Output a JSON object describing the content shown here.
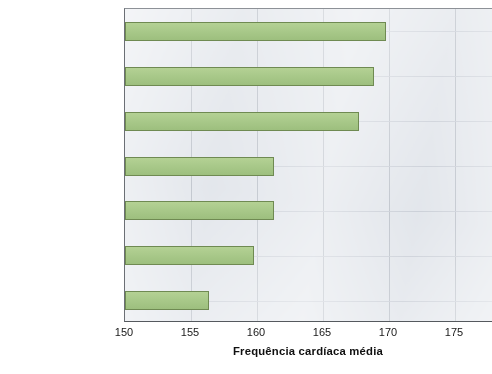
{
  "chart_data": {
    "type": "bar",
    "orientation": "horizontal",
    "title": "",
    "xlabel": "Frequência cardíaca média",
    "ylabel": "",
    "xlim": [
      150,
      176
    ],
    "xticks": [
      150,
      155,
      160,
      165,
      170,
      175
    ],
    "xtick_labels": [
      "150",
      "155",
      "160",
      "165",
      "170",
      "175"
    ],
    "grid": true,
    "legend": "none",
    "categories": [
      "Flanagan (2002)",
      "Ali (1991)",
      "Van Gool (1988)",
      "Florida-James (1995)",
      "Ogushi (1993)",
      "Bangsbo (1991)",
      "Reilly (1986)"
    ],
    "values": [
      169.8,
      168.9,
      167.7,
      161.3,
      161.3,
      159.8,
      156.4
    ],
    "bars": [
      {
        "author": "Flanagan",
        "year": "(2002)",
        "value": 169.8
      },
      {
        "author": "Ali",
        "year": "(1991)",
        "value": 168.9
      },
      {
        "author": "Van Gool",
        "year": "(1988)",
        "value": 167.7
      },
      {
        "author": "Florida-James",
        "year": "(1995)",
        "value": 161.3
      },
      {
        "author": "Ogushi",
        "year": "(1993)",
        "value": 161.3
      },
      {
        "author": "Bangsbo",
        "year": "(1991)",
        "value": 159.8
      },
      {
        "author": "Reilly",
        "year": "(1986)",
        "value": 156.4
      }
    ],
    "colors": {
      "bar_fill": "#a9c98a",
      "bar_border": "#6f8a52",
      "plot_background": "#dfe3e9",
      "gridline": "#b2b8c2",
      "axis": "#55595e",
      "text": "#1a1a1a"
    }
  },
  "caption_sliver": ""
}
